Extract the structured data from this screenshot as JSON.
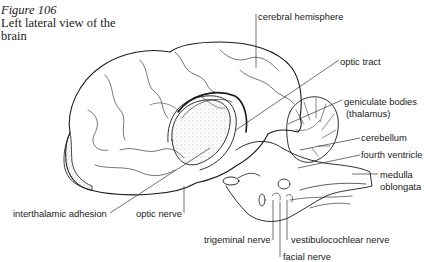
{
  "figure": {
    "number": "Figure 106",
    "title": "Left lateral view of the brain"
  },
  "labels": {
    "cerebral_hemisphere": "cerebral hemisphere",
    "optic_tract": "optic tract",
    "geniculate_bodies": "geniculate bodies",
    "thalamus": "(thalamus)",
    "cerebellum": "cerebellum",
    "fourth_ventricle": "fourth ventricle",
    "medulla": "medulla",
    "oblongata": "oblongata",
    "interthalamic_adhesion": "interthalamic adhesion",
    "optic_nerve": "optic nerve",
    "trigeminal_nerve": "trigeminal nerve",
    "vestibulocochlear_nerve": "vestibulocochlear nerve",
    "facial_nerve": "facial nerve"
  },
  "colors": {
    "ink": "#1a1a1a",
    "background": "#ffffff"
  }
}
